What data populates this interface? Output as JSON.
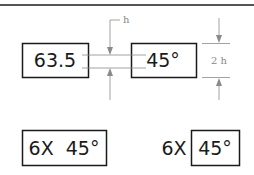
{
  "diagram": {
    "top_rule": true,
    "example_top": {
      "box_left": {
        "text": "63.5"
      },
      "box_right": {
        "text": "45°"
      },
      "letter_height_label": "h",
      "box_height_label": "2 h"
    },
    "example_bottom": {
      "combined_box": {
        "text": "6X  45°"
      },
      "prefix_text": "6X",
      "separate_box": {
        "text": "45°"
      }
    },
    "colors": {
      "line": "#1a1a1a",
      "dimension": "#8a8a8a",
      "rule": "#555555"
    }
  }
}
